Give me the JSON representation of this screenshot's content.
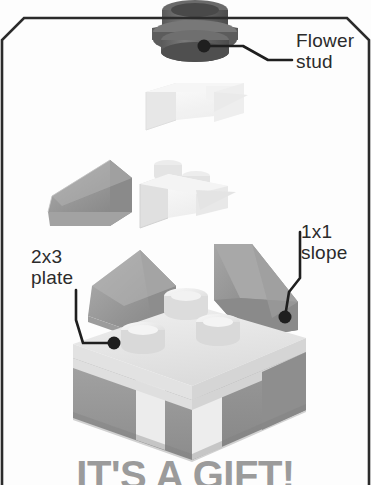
{
  "page": {
    "background_color": "#fdfdfd",
    "frame_color": "#2b2b2b",
    "width": 371,
    "height": 485
  },
  "callouts": [
    {
      "id": "flower-stud",
      "text": "Flower\nstud",
      "target_part": "flower-stud-piece",
      "leader_dot": {
        "x": 204,
        "y": 46
      }
    },
    {
      "id": "1x1-slope",
      "text": "1x1\nslope",
      "target_part": "right-slope-piece",
      "leader_dot": {
        "x": 285,
        "y": 317
      }
    },
    {
      "id": "2x3-plate",
      "text": "2x3\nplate",
      "target_part": "base-plate-piece",
      "leader_dot": {
        "x": 114,
        "y": 343
      }
    }
  ],
  "footer": {
    "text": "IT'S A GIFT!",
    "color": "#9b9b9b"
  },
  "parts": {
    "flower_stud": {
      "name": "flower-stud",
      "color": "#6d6d6d",
      "color_dark": "#4a4a4a"
    },
    "white_plate_top": {
      "name": "white-plate",
      "color": "#f3f3f3"
    },
    "gray_slope_left": {
      "name": "gray-slope",
      "color": "#9a9a9a"
    },
    "white_plate_mid": {
      "name": "white-plate-studs",
      "color": "#efefef"
    },
    "assembly": {
      "name": "gift-box-assembly",
      "box_light": "#e9e9e9",
      "box_gray": "#9a9a9a",
      "slope_gray": "#8f8f8f",
      "stud_white": "#f0f0f0"
    }
  }
}
